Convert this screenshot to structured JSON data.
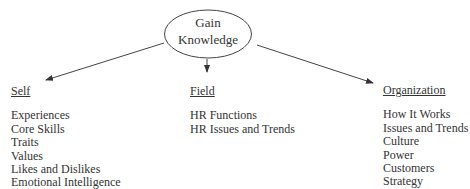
{
  "center": {
    "line1": "Gain",
    "line2": "Knowledge"
  },
  "columns": {
    "self": {
      "heading": "Self",
      "items": [
        "Experiences",
        "Core Skills",
        "Traits",
        "Values",
        "Likes and Dislikes",
        "Emotional Intelligence"
      ]
    },
    "field": {
      "heading": "Field",
      "items": [
        "HR Functions",
        "HR Issues and Trends"
      ]
    },
    "organization": {
      "heading": "Organization",
      "items": [
        "How It Works",
        "Issues and Trends",
        "Culture",
        "Power",
        "Customers",
        "Strategy"
      ]
    }
  },
  "colors": {
    "ink": "#333333",
    "background": "#ffffff"
  }
}
